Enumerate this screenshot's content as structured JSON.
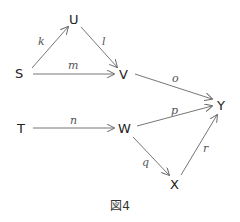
{
  "diagram": {
    "type": "directed-graph",
    "caption": "図4",
    "nodes": [
      {
        "id": "S",
        "label": "S",
        "x": 20,
        "y": 78
      },
      {
        "id": "U",
        "label": "U",
        "x": 74,
        "y": 24
      },
      {
        "id": "V",
        "label": "V",
        "x": 124,
        "y": 79
      },
      {
        "id": "Y",
        "label": "Y",
        "x": 222,
        "y": 110
      },
      {
        "id": "T",
        "label": "T",
        "x": 22,
        "y": 133
      },
      {
        "id": "W",
        "label": "W",
        "x": 125,
        "y": 133
      },
      {
        "id": "X",
        "label": "X",
        "x": 175,
        "y": 189
      }
    ],
    "edges": [
      {
        "from": "S",
        "to": "U",
        "label": "k"
      },
      {
        "from": "U",
        "to": "V",
        "label": "l"
      },
      {
        "from": "S",
        "to": "V",
        "label": "m"
      },
      {
        "from": "V",
        "to": "Y",
        "label": "o"
      },
      {
        "from": "W",
        "to": "Y",
        "label": "p"
      },
      {
        "from": "T",
        "to": "W",
        "label": "n"
      },
      {
        "from": "W",
        "to": "X",
        "label": "q"
      },
      {
        "from": "X",
        "to": "Y",
        "label": "r"
      }
    ]
  }
}
